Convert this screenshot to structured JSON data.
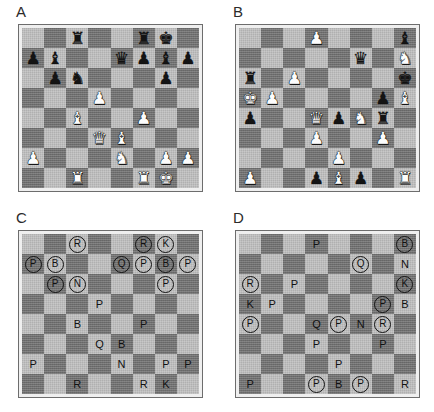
{
  "figure": {
    "panels": [
      {
        "id": "A",
        "label": "A",
        "render": "pieces",
        "rows": [
          [
            null,
            null,
            {
              "piece": "rook",
              "color": "black"
            },
            null,
            null,
            {
              "piece": "rook",
              "color": "black"
            },
            {
              "piece": "king",
              "color": "black"
            },
            null
          ],
          [
            {
              "piece": "pawn",
              "color": "black"
            },
            {
              "piece": "bishop",
              "color": "black"
            },
            null,
            null,
            {
              "piece": "queen",
              "color": "black"
            },
            {
              "piece": "pawn",
              "color": "black"
            },
            {
              "piece": "bishop",
              "color": "black"
            },
            {
              "piece": "pawn",
              "color": "black"
            }
          ],
          [
            null,
            {
              "piece": "pawn",
              "color": "black"
            },
            {
              "piece": "knight",
              "color": "black"
            },
            null,
            null,
            null,
            {
              "piece": "pawn",
              "color": "black"
            },
            null
          ],
          [
            null,
            null,
            null,
            {
              "piece": "pawn",
              "color": "white"
            },
            null,
            null,
            null,
            null
          ],
          [
            null,
            null,
            {
              "piece": "bishop",
              "color": "white"
            },
            null,
            null,
            {
              "piece": "pawn",
              "color": "white"
            },
            null,
            null
          ],
          [
            null,
            null,
            null,
            {
              "piece": "queen",
              "color": "white"
            },
            {
              "piece": "bishop",
              "color": "white"
            },
            null,
            null,
            null
          ],
          [
            {
              "piece": "pawn",
              "color": "white"
            },
            null,
            null,
            null,
            {
              "piece": "knight",
              "color": "white"
            },
            null,
            {
              "piece": "pawn",
              "color": "white"
            },
            {
              "piece": "pawn",
              "color": "white"
            }
          ],
          [
            null,
            null,
            {
              "piece": "rook",
              "color": "white"
            },
            null,
            null,
            {
              "piece": "rook",
              "color": "white"
            },
            {
              "piece": "king",
              "color": "white"
            },
            null
          ]
        ]
      },
      {
        "id": "B",
        "label": "B",
        "render": "pieces",
        "rows": [
          [
            null,
            null,
            null,
            {
              "piece": "pawn",
              "color": "white"
            },
            null,
            null,
            null,
            {
              "piece": "bishop",
              "color": "black"
            }
          ],
          [
            null,
            null,
            null,
            null,
            null,
            {
              "piece": "queen",
              "color": "black"
            },
            null,
            {
              "piece": "knight",
              "color": "white"
            }
          ],
          [
            {
              "piece": "rook",
              "color": "black"
            },
            null,
            {
              "piece": "pawn",
              "color": "white"
            },
            null,
            null,
            null,
            null,
            {
              "piece": "king",
              "color": "black"
            }
          ],
          [
            {
              "piece": "king",
              "color": "white"
            },
            {
              "piece": "pawn",
              "color": "white"
            },
            null,
            null,
            null,
            null,
            {
              "piece": "pawn",
              "color": "black"
            },
            {
              "piece": "bishop",
              "color": "white"
            }
          ],
          [
            {
              "piece": "pawn",
              "color": "black"
            },
            null,
            null,
            {
              "piece": "queen",
              "color": "white"
            },
            {
              "piece": "pawn",
              "color": "black"
            },
            {
              "piece": "knight",
              "color": "white"
            },
            {
              "piece": "rook",
              "color": "black"
            },
            null
          ],
          [
            null,
            null,
            null,
            {
              "piece": "pawn",
              "color": "white"
            },
            null,
            null,
            {
              "piece": "pawn",
              "color": "white"
            },
            null
          ],
          [
            null,
            null,
            null,
            null,
            {
              "piece": "pawn",
              "color": "white"
            },
            null,
            null,
            null
          ],
          [
            {
              "piece": "pawn",
              "color": "white"
            },
            null,
            null,
            {
              "piece": "pawn",
              "color": "black"
            },
            {
              "piece": "bishop",
              "color": "white"
            },
            {
              "piece": "pawn",
              "color": "black"
            },
            null,
            {
              "piece": "rook",
              "color": "white"
            }
          ]
        ]
      },
      {
        "id": "C",
        "label": "C",
        "render": "letters",
        "rows": [
          [
            null,
            null,
            {
              "letter": "R",
              "circled": true
            },
            null,
            null,
            {
              "letter": "R",
              "circled": true
            },
            {
              "letter": "K",
              "circled": true
            },
            null
          ],
          [
            {
              "letter": "P",
              "circled": true
            },
            {
              "letter": "B",
              "circled": true
            },
            null,
            null,
            {
              "letter": "Q",
              "circled": true
            },
            {
              "letter": "P",
              "circled": true
            },
            {
              "letter": "B",
              "circled": true
            },
            {
              "letter": "P",
              "circled": true
            }
          ],
          [
            null,
            {
              "letter": "P",
              "circled": true
            },
            {
              "letter": "N",
              "circled": true
            },
            null,
            null,
            null,
            {
              "letter": "P",
              "circled": true
            },
            null
          ],
          [
            null,
            null,
            null,
            {
              "letter": "P",
              "circled": false
            },
            null,
            null,
            null,
            null
          ],
          [
            null,
            null,
            {
              "letter": "B",
              "circled": false
            },
            null,
            null,
            {
              "letter": "P",
              "circled": false
            },
            null,
            null
          ],
          [
            null,
            null,
            null,
            {
              "letter": "Q",
              "circled": false
            },
            {
              "letter": "B",
              "circled": false
            },
            null,
            null,
            null
          ],
          [
            {
              "letter": "P",
              "circled": false
            },
            null,
            null,
            null,
            {
              "letter": "N",
              "circled": false
            },
            null,
            {
              "letter": "P",
              "circled": false
            },
            {
              "letter": "P",
              "circled": false
            }
          ],
          [
            null,
            null,
            {
              "letter": "R",
              "circled": false
            },
            null,
            null,
            {
              "letter": "R",
              "circled": false
            },
            {
              "letter": "K",
              "circled": false
            },
            null
          ]
        ]
      },
      {
        "id": "D",
        "label": "D",
        "render": "letters",
        "rows": [
          [
            null,
            null,
            null,
            {
              "letter": "P",
              "circled": false
            },
            null,
            null,
            null,
            {
              "letter": "B",
              "circled": true
            }
          ],
          [
            null,
            null,
            null,
            null,
            null,
            {
              "letter": "Q",
              "circled": true
            },
            null,
            {
              "letter": "N",
              "circled": false
            }
          ],
          [
            {
              "letter": "R",
              "circled": true
            },
            null,
            {
              "letter": "P",
              "circled": false
            },
            null,
            null,
            null,
            null,
            {
              "letter": "K",
              "circled": true
            }
          ],
          [
            {
              "letter": "K",
              "circled": false
            },
            {
              "letter": "P",
              "circled": false
            },
            null,
            null,
            null,
            null,
            {
              "letter": "P",
              "circled": true
            },
            {
              "letter": "B",
              "circled": false
            }
          ],
          [
            {
              "letter": "P",
              "circled": true
            },
            null,
            null,
            {
              "letter": "Q",
              "circled": false
            },
            {
              "letter": "P",
              "circled": true
            },
            {
              "letter": "N",
              "circled": false
            },
            {
              "letter": "R",
              "circled": true
            },
            null
          ],
          [
            null,
            null,
            null,
            {
              "letter": "P",
              "circled": false
            },
            null,
            null,
            {
              "letter": "P",
              "circled": false
            },
            null
          ],
          [
            null,
            null,
            null,
            null,
            {
              "letter": "P",
              "circled": false
            },
            null,
            null,
            null
          ],
          [
            {
              "letter": "P",
              "circled": false
            },
            null,
            null,
            {
              "letter": "P",
              "circled": true
            },
            {
              "letter": "B",
              "circled": false
            },
            {
              "letter": "P",
              "circled": true
            },
            null,
            {
              "letter": "R",
              "circled": false
            }
          ]
        ]
      }
    ],
    "glyphs": {
      "king": "♚",
      "queen": "♛",
      "rook": "♜",
      "bishop": "♝",
      "knight": "♞",
      "pawn": "♟"
    },
    "colors": {
      "light_square": "#bdbdbd",
      "dark_square": "#6f6f6f",
      "board_border": "#6d6d6d",
      "board_mat": "#efefef",
      "black_piece": "#141414",
      "white_piece": "#fcfcfc",
      "label_text": "#2b2b2b",
      "page_background": "#ffffff"
    }
  }
}
